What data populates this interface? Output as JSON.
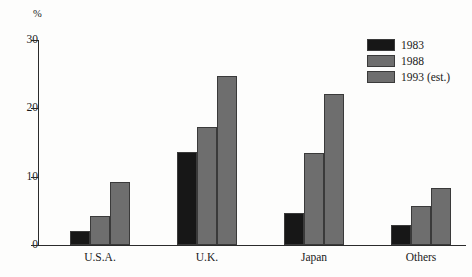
{
  "chart_data": {
    "type": "bar",
    "title": "",
    "subtitle": "",
    "xlabel": "",
    "ylabel": "%",
    "ylim": [
      0,
      30
    ],
    "yticks": [
      "0",
      "10",
      "20",
      "30"
    ],
    "ytick_values": [
      0,
      10,
      20,
      30
    ],
    "grid": false,
    "legend_position": "top-right",
    "categories": [
      "U.S.A.",
      "U.K.",
      "Japan",
      "Others"
    ],
    "series": [
      {
        "name": "1983",
        "color": "#171717",
        "values": [
          2.1,
          13.6,
          4.7,
          3.0
        ]
      },
      {
        "name": "1988",
        "color": "#6e6e6e",
        "values": [
          4.3,
          17.2,
          13.4,
          5.7
        ]
      },
      {
        "name": "1993 (est.)",
        "color": "#6e6e6e",
        "values": [
          9.2,
          24.7,
          22.1,
          8.4
        ]
      }
    ]
  },
  "axis": {
    "percent_symbol": "%",
    "axis_color": "#2b2b2b"
  },
  "legend": {
    "entries": [
      {
        "label": "1983",
        "color": "#171717"
      },
      {
        "label": "1988",
        "color": "#6e6e6e"
      },
      {
        "label": "1993 (est.)",
        "color": "#6e6e6e"
      }
    ]
  }
}
